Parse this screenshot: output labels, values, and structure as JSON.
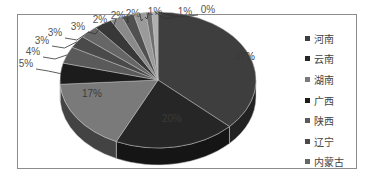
{
  "chart_data": {
    "type": "pie",
    "style": "3d-exploded-pie",
    "title": "",
    "categories": [
      "河南",
      "云南",
      "湖南",
      "广西",
      "陕西",
      "辽宁",
      "内蒙古",
      "",
      "",
      "",
      "",
      "",
      "",
      ""
    ],
    "values": [
      37,
      20,
      17,
      5,
      4,
      3,
      3,
      3,
      2,
      2,
      2,
      1,
      1,
      0
    ],
    "labels": [
      "37%",
      "20%",
      "17%",
      "5%",
      "4%",
      "3%",
      "3%",
      "3%",
      "2%",
      "2%",
      "2%",
      "1%",
      "1%",
      "0%"
    ],
    "colors": [
      "#3e3e3e",
      "#262626",
      "#7a7a7a",
      "#1c1c1c",
      "#5a5a5a",
      "#4a4a4a",
      "#666666",
      "#383838",
      "#8a8a8a",
      "#505050",
      "#9a9a9a",
      "#6e6e6e",
      "#b0b0b0",
      "#444444"
    ],
    "legend": {
      "position": "right",
      "entries": [
        "河南",
        "云南",
        "湖南",
        "广西",
        "陕西",
        "辽宁",
        "内蒙古"
      ]
    }
  },
  "legend": {
    "items": [
      {
        "label": "河南",
        "color": "#3e3e3e"
      },
      {
        "label": "云南",
        "color": "#262626"
      },
      {
        "label": "湖南",
        "color": "#7a7a7a"
      },
      {
        "label": "广西",
        "color": "#1c1c1c"
      },
      {
        "label": "陕西",
        "color": "#5a5a5a"
      },
      {
        "label": "辽宁",
        "color": "#4a4a4a"
      },
      {
        "label": "内蒙古",
        "color": "#666666"
      }
    ]
  }
}
